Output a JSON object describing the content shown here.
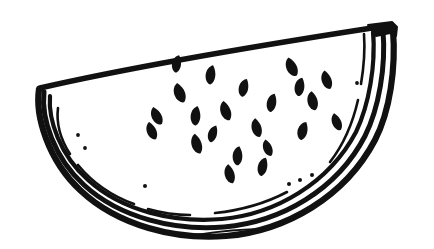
{
  "artwork": {
    "title": "Watermelon Slice Line Drawing",
    "subject": "watermelon-slice",
    "style": "hand-drawn black ink outline, no fill, white background",
    "canvas": {
      "width": 434,
      "height": 249,
      "background_color": "#ffffff"
    },
    "ink_color": "#111111",
    "parts": {
      "top_edge": {
        "name": "cut-face-top-edge",
        "description": "long nearly straight slightly bowed line from left tip up to the right corner cap",
        "path": "M40,88 C110,72 230,50 372,28",
        "stroke_width": 5.4
      },
      "right_corner_cap": {
        "name": "top-right-corner-cap",
        "description": "squared-off blocky cap where the top edge meets the rind at the right end",
        "path": "M368,25 L392,22 L397,27 L396,36 L390,33 L376,36 Z",
        "stroke_width": 2.0
      },
      "rind_outer": {
        "name": "rind-outer-edge",
        "description": "thick outer arc of the green rind, from left tip sweeping under and up to the right cap",
        "path": "M39,89 C35,116 48,160 80,190 C118,226 176,240 226,236 C286,231 345,197 375,140 C390,111 396,68 393,30",
        "stroke_width": 6.2
      },
      "rind_inner": {
        "name": "rind-inner-edge",
        "description": "second arc just inside the outer rind line, defining rind thickness",
        "path": "M44,92 C41,118 54,158 84,185 C120,218 175,231 224,227 C281,222 337,190 365,136 C379,108 386,66 383,31",
        "stroke_width": 5.0
      },
      "flesh_boundary": {
        "name": "flesh-inner-boundary",
        "description": "third arc marking where the pink flesh meets the white rind",
        "path": "M50,96 C48,120 60,155 88,180 C122,211 174,223 222,219 C276,214 329,183 356,132 C369,105 376,64 373,32",
        "stroke_width": 4.2
      },
      "dashed_inner_arc": {
        "name": "flesh-dashed-accent-arc",
        "description": "innermost broken/dashed accent line following the flesh curve with gaps and specks",
        "segments": [
          {
            "name": "dash-left-upper",
            "path": "M58,108 C56,124 61,140 70,154",
            "stroke_width": 2.6
          },
          {
            "name": "dash-left-lower",
            "path": "M78,165 C92,182 112,196 134,204",
            "stroke_width": 2.6
          },
          {
            "name": "dash-bottom-left",
            "path": "M148,209 C162,213 176,215 190,215",
            "stroke_width": 2.6
          },
          {
            "name": "dash-bottom-right",
            "path": "M215,213 C244,210 268,202 287,192",
            "stroke_width": 2.6
          },
          {
            "name": "dash-right-lower",
            "path": "M330,162 C344,144 353,122 358,100",
            "stroke_width": 2.6
          },
          {
            "name": "dash-right-upper",
            "path": "M361,84 C364,66 365,48 364,34",
            "stroke_width": 2.6
          }
        ]
      },
      "stray_bottom_line": {
        "name": "stray-bottom-stroke",
        "description": "thin detached stroke floating just below the bottom of the rind",
        "path": "M196,235 C220,231 246,229 266,229",
        "stroke_width": 1.8
      },
      "right_notch_line": {
        "name": "right-inner-notch-stroke",
        "description": "short vertical stroke hanging from the right corner cap into the flesh",
        "path": "M374,33 L373,57",
        "stroke_width": 3.0
      }
    },
    "seeds": {
      "name": "watermelon-seeds",
      "count": 22,
      "color": "#111111",
      "shape": "teardrop / almond",
      "items": [
        {
          "id": "seed-01",
          "cx": 180,
          "cy": 93,
          "rx": 6.4,
          "ry": 10.4,
          "rotate": -16
        },
        {
          "id": "seed-02",
          "cx": 211,
          "cy": 75,
          "rx": 5.8,
          "ry": 10.0,
          "rotate": 12
        },
        {
          "id": "seed-03",
          "cx": 226,
          "cy": 111,
          "rx": 6.0,
          "ry": 10.2,
          "rotate": -14
        },
        {
          "id": "seed-04",
          "cx": 244,
          "cy": 88,
          "rx": 5.6,
          "ry": 9.4,
          "rotate": 18
        },
        {
          "id": "seed-05",
          "cx": 257,
          "cy": 128,
          "rx": 5.8,
          "ry": 9.8,
          "rotate": -10
        },
        {
          "id": "seed-06",
          "cx": 272,
          "cy": 103,
          "rx": 5.6,
          "ry": 9.6,
          "rotate": 16
        },
        {
          "id": "seed-07",
          "cx": 292,
          "cy": 67,
          "rx": 6.2,
          "ry": 10.2,
          "rotate": -20
        },
        {
          "id": "seed-08",
          "cx": 300,
          "cy": 87,
          "rx": 5.8,
          "ry": 9.6,
          "rotate": 14
        },
        {
          "id": "seed-09",
          "cx": 313,
          "cy": 101,
          "rx": 6.0,
          "ry": 9.8,
          "rotate": -8
        },
        {
          "id": "seed-10",
          "cx": 303,
          "cy": 131,
          "rx": 5.8,
          "ry": 9.6,
          "rotate": 20
        },
        {
          "id": "seed-11",
          "cx": 327,
          "cy": 80,
          "rx": 5.8,
          "ry": 9.8,
          "rotate": -14
        },
        {
          "id": "seed-12",
          "cx": 157,
          "cy": 116,
          "rx": 5.8,
          "ry": 9.8,
          "rotate": -22
        },
        {
          "id": "seed-13",
          "cx": 196,
          "cy": 116,
          "rx": 5.8,
          "ry": 10.0,
          "rotate": 10
        },
        {
          "id": "seed-14",
          "cx": 197,
          "cy": 144,
          "rx": 6.0,
          "ry": 10.4,
          "rotate": -12
        },
        {
          "id": "seed-15",
          "cx": 213,
          "cy": 134,
          "rx": 5.2,
          "ry": 9.0,
          "rotate": 22
        },
        {
          "id": "seed-16",
          "cx": 152,
          "cy": 131,
          "rx": 5.6,
          "ry": 9.4,
          "rotate": -18
        },
        {
          "id": "seed-17",
          "cx": 238,
          "cy": 156,
          "rx": 5.8,
          "ry": 9.8,
          "rotate": 8
        },
        {
          "id": "seed-18",
          "cx": 230,
          "cy": 174,
          "rx": 5.8,
          "ry": 10.0,
          "rotate": -10
        },
        {
          "id": "seed-19",
          "cx": 263,
          "cy": 167,
          "rx": 5.6,
          "ry": 9.6,
          "rotate": 18
        },
        {
          "id": "seed-20",
          "cx": 268,
          "cy": 148,
          "rx": 5.2,
          "ry": 8.8,
          "rotate": -16
        },
        {
          "id": "seed-21",
          "cx": 177,
          "cy": 64,
          "rx": 5.4,
          "ry": 9.0,
          "rotate": 14
        },
        {
          "id": "seed-22",
          "cx": 337,
          "cy": 122,
          "rx": 5.4,
          "ry": 9.2,
          "rotate": -18
        }
      ]
    },
    "specks": {
      "name": "rind-texture-specks",
      "count": 7,
      "color": "#111111",
      "items": [
        {
          "id": "speck-1",
          "cx": 78,
          "cy": 135,
          "r": 1.9
        },
        {
          "id": "speck-2",
          "cx": 85,
          "cy": 148,
          "r": 1.9
        },
        {
          "id": "speck-3",
          "cx": 145,
          "cy": 186,
          "r": 2.0
        },
        {
          "id": "speck-4",
          "cx": 289,
          "cy": 184,
          "r": 2.0
        },
        {
          "id": "speck-5",
          "cx": 300,
          "cy": 180,
          "r": 2.0
        },
        {
          "id": "speck-6",
          "cx": 312,
          "cy": 175,
          "r": 2.0
        },
        {
          "id": "speck-7",
          "cx": 357,
          "cy": 83,
          "r": 1.9
        }
      ]
    }
  }
}
